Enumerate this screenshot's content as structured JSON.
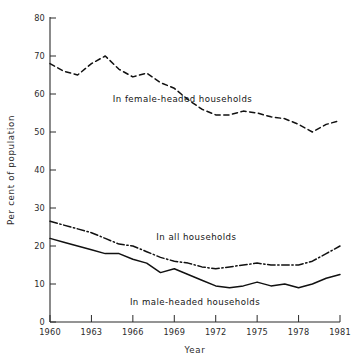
{
  "chart_data": {
    "type": "line",
    "title": "",
    "xlabel": "Year",
    "ylabel": "Per cent of population",
    "xlim": [
      1960,
      1981
    ],
    "ylim": [
      0,
      80
    ],
    "xticks": [
      1960,
      1963,
      1966,
      1969,
      1972,
      1975,
      1978,
      1981
    ],
    "xtick_labels": [
      "1960",
      "1963",
      "1966",
      "1969",
      "1972",
      "1975",
      "1978",
      "1981"
    ],
    "yticks": [
      0,
      10,
      20,
      30,
      40,
      50,
      60,
      70,
      80
    ],
    "ytick_labels": [
      "0",
      "10",
      "20",
      "30",
      "40",
      "50",
      "60",
      "70",
      "80"
    ],
    "grid": false,
    "legend_position": "inline-annotations",
    "x": [
      1960,
      1961,
      1962,
      1963,
      1964,
      1965,
      1966,
      1967,
      1968,
      1969,
      1970,
      1971,
      1972,
      1973,
      1974,
      1975,
      1976,
      1977,
      1978,
      1979,
      1980,
      1981
    ],
    "series": [
      {
        "name": "In female-headed households",
        "line_style": "dashed",
        "annotation": "In female-headed households",
        "values": [
          68.0,
          66.0,
          65.0,
          68.0,
          70.0,
          66.5,
          64.5,
          65.5,
          63.0,
          61.5,
          58.5,
          56.0,
          54.5,
          54.5,
          55.5,
          55.0,
          54.0,
          53.5,
          52.0,
          50.0,
          52.0,
          53.0
        ]
      },
      {
        "name": "In all households",
        "line_style": "dash-dot",
        "annotation": "In all households",
        "values": [
          26.5,
          25.5,
          24.5,
          23.5,
          22.0,
          20.5,
          20.0,
          18.5,
          17.0,
          16.0,
          15.5,
          14.5,
          14.0,
          14.5,
          15.0,
          15.5,
          15.0,
          15.0,
          15.0,
          16.0,
          18.0,
          20.0
        ]
      },
      {
        "name": "In male-headed households",
        "line_style": "solid",
        "annotation": "In male-headed households",
        "values": [
          22.0,
          21.0,
          20.0,
          19.0,
          18.0,
          18.0,
          16.5,
          15.5,
          13.0,
          14.0,
          12.5,
          11.0,
          9.5,
          9.0,
          9.5,
          10.5,
          9.5,
          10.0,
          9.0,
          10.0,
          11.5,
          12.5
        ]
      }
    ]
  },
  "annotations": {
    "female": {
      "text": "In female-headed households",
      "x": 1969.6,
      "y": 58.0
    },
    "all": {
      "text": "In all households",
      "x": 1970.6,
      "y": 21.5
    },
    "male": {
      "text": "In male-headed households",
      "x": 1970.5,
      "y": 4.5
    }
  },
  "colors": {
    "line": "#111111",
    "axis": "#2b2b2b",
    "background": "#ffffff",
    "text": "#1a1a1a"
  }
}
